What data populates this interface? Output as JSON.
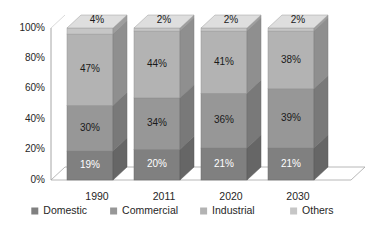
{
  "chart_data": {
    "type": "bar",
    "subtype": "stacked-column-3d",
    "title": "",
    "subtitle": "",
    "xlabel": "",
    "ylabel": "",
    "categories": [
      "1990",
      "2011",
      "2020",
      "2030"
    ],
    "series": [
      {
        "name": "Domestic",
        "values": [
          19,
          20,
          21,
          21
        ],
        "color": "#808080"
      },
      {
        "name": "Commercial",
        "values": [
          30,
          34,
          36,
          39
        ],
        "color": "#979797"
      },
      {
        "name": "Industrial",
        "values": [
          47,
          44,
          41,
          38
        ],
        "color": "#b3b3b3"
      },
      {
        "name": "Others",
        "values": [
          4,
          2,
          2,
          2
        ],
        "color": "#c6c6c6"
      }
    ],
    "stack_order_bottom_to_top": [
      "Domestic",
      "Commercial",
      "Industrial",
      "Others"
    ],
    "data_labels": {
      "1990": {
        "Domestic": "19%",
        "Commercial": "30%",
        "Industrial": "47%",
        "Others": "4%"
      },
      "2011": {
        "Domestic": "20%",
        "Commercial": "34%",
        "Industrial": "44%",
        "Others": "2%"
      },
      "2020": {
        "Domestic": "21%",
        "Commercial": "36%",
        "Industrial": "41%",
        "Others": "2%"
      },
      "2030": {
        "Domestic": "21%",
        "Commercial": "39%",
        "Industrial": "38%",
        "Others": "2%"
      }
    },
    "ylim": [
      0,
      100
    ],
    "yticks": [
      0,
      20,
      40,
      60,
      80,
      100
    ],
    "ytick_labels": [
      "0%",
      "20%",
      "40%",
      "60%",
      "80%",
      "100%"
    ],
    "grid": false,
    "legend_position": "bottom",
    "legend_marker": "square",
    "background": "#ffffff",
    "axis_color": "#a6a6a6",
    "text_color": "#262626"
  },
  "axis": {
    "ticks": [
      {
        "label": "100%"
      },
      {
        "label": "80%"
      },
      {
        "label": "60%"
      },
      {
        "label": "40%"
      },
      {
        "label": "20%"
      },
      {
        "label": "0%"
      }
    ]
  },
  "categories": [
    {
      "label": "1990"
    },
    {
      "label": "2011"
    },
    {
      "label": "2020"
    },
    {
      "label": "2030"
    }
  ],
  "legend": {
    "items": [
      {
        "label": "Domestic"
      },
      {
        "label": "Commercial"
      },
      {
        "label": "Industrial"
      },
      {
        "label": "Others"
      }
    ]
  },
  "bars": [
    {
      "category": "1990",
      "segments": [
        {
          "series": "Others",
          "label": "4%"
        },
        {
          "series": "Industrial",
          "label": "47%"
        },
        {
          "series": "Commercial",
          "label": "30%"
        },
        {
          "series": "Domestic",
          "label": "19%"
        }
      ]
    },
    {
      "category": "2011",
      "segments": [
        {
          "series": "Others",
          "label": "2%"
        },
        {
          "series": "Industrial",
          "label": "44%"
        },
        {
          "series": "Commercial",
          "label": "34%"
        },
        {
          "series": "Domestic",
          "label": "20%"
        }
      ]
    },
    {
      "category": "2020",
      "segments": [
        {
          "series": "Others",
          "label": "2%"
        },
        {
          "series": "Industrial",
          "label": "41%"
        },
        {
          "series": "Commercial",
          "label": "36%"
        },
        {
          "series": "Domestic",
          "label": "21%"
        }
      ]
    },
    {
      "category": "2030",
      "segments": [
        {
          "series": "Others",
          "label": "2%"
        },
        {
          "series": "Industrial",
          "label": "38%"
        },
        {
          "series": "Commercial",
          "label": "39%"
        },
        {
          "series": "Domestic",
          "label": "21%"
        }
      ]
    }
  ]
}
